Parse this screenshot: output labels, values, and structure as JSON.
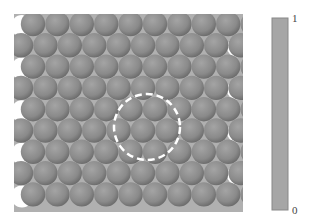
{
  "figure": {
    "panel": {
      "x": 14,
      "y": 14,
      "width": 229,
      "height": 198,
      "color": "#aaaaaa"
    },
    "particles": {
      "rows": 9,
      "per_row": 10,
      "radius": 12.2,
      "spacing_x": 24.4,
      "spacing_y": 21.3,
      "first_x_even": 33,
      "first_x_odd": 21,
      "first_y": 24,
      "color": "#8c8c8c",
      "highlight": "#a8a8a8",
      "shadow": "#666666"
    },
    "highlight_circle": {
      "cx": 147,
      "cy": 127,
      "r": 33,
      "color": "#ffffff",
      "style": "dashed"
    },
    "colorbar": {
      "x": 272,
      "y": 18,
      "width": 16,
      "height": 192,
      "color": "#a6a6a6",
      "border": "#888888",
      "max_label": "1",
      "min_label": "0"
    }
  }
}
